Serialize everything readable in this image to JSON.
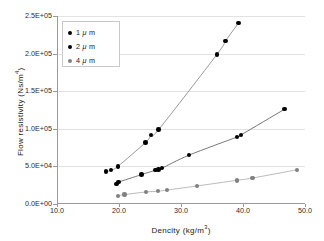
{
  "chart_data": {
    "type": "scatter",
    "title": "",
    "xlabel": "Dencity (kg/m3)",
    "ylabel": "Flow resistivity (Ns/m4)",
    "xlim": [
      10.0,
      50.0
    ],
    "ylim": [
      0,
      250000
    ],
    "xticks": [
      "10.0",
      "20.0",
      "30.0",
      "40.0",
      "50.0"
    ],
    "xtick_values": [
      10.0,
      20.0,
      30.0,
      40.0,
      50.0
    ],
    "yticks": [
      "0.0E+00",
      "5.0E+04",
      "1.0E+05",
      "1.5E+05",
      "2.0E+05",
      "2.5E+05"
    ],
    "ytick_values": [
      0,
      50000,
      100000,
      150000,
      200000,
      250000
    ],
    "grid": "horizontal",
    "legend_position": "top-left",
    "series": [
      {
        "name": "1 μ m",
        "color": "#000000",
        "line_color": "#7d7d7d",
        "points": [
          {
            "x": 17.9,
            "y": 43000
          },
          {
            "x": 18.7,
            "y": 45000
          },
          {
            "x": 19.8,
            "y": 50000
          },
          {
            "x": 24.3,
            "y": 82000
          },
          {
            "x": 25.2,
            "y": 92000
          },
          {
            "x": 26.4,
            "y": 99000
          },
          {
            "x": 35.8,
            "y": 199000
          },
          {
            "x": 37.2,
            "y": 217000
          },
          {
            "x": 39.3,
            "y": 241000
          }
        ]
      },
      {
        "name": "2 μ m",
        "color": "#000000",
        "line_color": "#555555",
        "points": [
          {
            "x": 19.6,
            "y": 27000
          },
          {
            "x": 19.9,
            "y": 29000
          },
          {
            "x": 23.6,
            "y": 39000
          },
          {
            "x": 25.9,
            "y": 45000
          },
          {
            "x": 26.4,
            "y": 46000
          },
          {
            "x": 26.9,
            "y": 47500
          },
          {
            "x": 31.3,
            "y": 65000
          },
          {
            "x": 39.0,
            "y": 89000
          },
          {
            "x": 39.7,
            "y": 92000
          },
          {
            "x": 46.7,
            "y": 126000
          }
        ]
      },
      {
        "name": "4 μ m",
        "color": "#808080",
        "line_color": "#a8a8a8",
        "points": [
          {
            "x": 19.8,
            "y": 11000
          },
          {
            "x": 20.9,
            "y": 12500
          },
          {
            "x": 24.4,
            "y": 16000
          },
          {
            "x": 26.3,
            "y": 17000
          },
          {
            "x": 27.7,
            "y": 18500
          },
          {
            "x": 32.6,
            "y": 24000
          },
          {
            "x": 39.0,
            "y": 31500
          },
          {
            "x": 41.5,
            "y": 34500
          },
          {
            "x": 48.7,
            "y": 45500
          }
        ]
      }
    ]
  },
  "axis": {
    "x_title_text": "Dencity (kg/m",
    "x_title_sup": "3",
    "x_title_close": ")",
    "y_title_text": "Flow resistivity (Ns/m",
    "y_title_sup": "4",
    "y_title_close": ")"
  },
  "legend": {
    "items": [
      {
        "label_num": "1",
        "label_unit": "m",
        "mu": "μ",
        "color": "#000000"
      },
      {
        "label_num": "2",
        "label_unit": "m",
        "mu": "μ",
        "color": "#000000"
      },
      {
        "label_num": "4",
        "label_unit": "m",
        "mu": "μ",
        "color": "#808080"
      }
    ]
  },
  "colors": {
    "background": "#ffffff",
    "axis": "#9a9a9a",
    "grid": "#e2e2e2",
    "text": "#1a1a1a"
  }
}
